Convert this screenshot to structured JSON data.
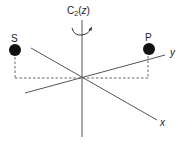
{
  "diagram": {
    "rotation_axis_label": {
      "prefix": "C",
      "subscript": "2",
      "argument": "z",
      "open_paren": "(",
      "close_paren": ")"
    },
    "axes": {
      "z": {
        "label": ""
      },
      "y": {
        "label": "y"
      },
      "x": {
        "label": "x"
      }
    },
    "atoms": [
      {
        "id": "S",
        "label": "S"
      },
      {
        "id": "P",
        "label": "P"
      }
    ],
    "colors": {
      "line": "#555555",
      "atom": "#111111",
      "text": "#222222"
    }
  }
}
